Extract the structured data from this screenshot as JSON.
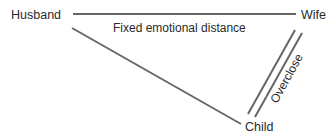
{
  "nodes": {
    "husband": {
      "label": "Husband"
    },
    "wife": {
      "label": "Wife"
    },
    "child": {
      "label": "Child"
    }
  },
  "edges": {
    "husband_wife": {
      "label": "Fixed emotional distance",
      "style": "single-line"
    },
    "husband_child": {
      "label": "",
      "style": "single-line"
    },
    "wife_child": {
      "label": "Overclose",
      "style": "double-line"
    }
  },
  "colors": {
    "line": "#666666",
    "text": "#2a2a2a",
    "background": "#ffffff"
  }
}
